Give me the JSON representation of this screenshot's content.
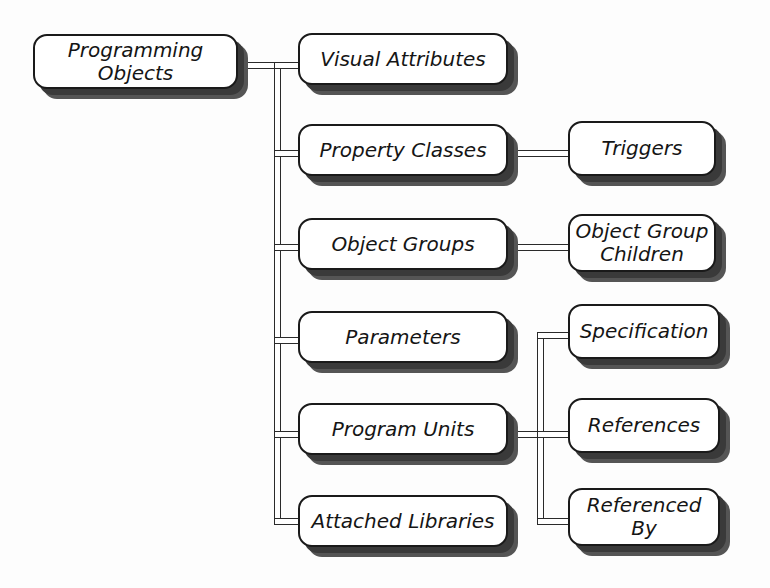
{
  "diagram": {
    "root": {
      "label": "Programming Objects"
    },
    "level1": [
      {
        "label": "Visual Attributes"
      },
      {
        "label": "Property Classes"
      },
      {
        "label": "Object Groups"
      },
      {
        "label": "Parameters"
      },
      {
        "label": "Program Units"
      },
      {
        "label": "Attached Libraries"
      }
    ],
    "level2": {
      "property_classes": [
        {
          "label": "Triggers"
        }
      ],
      "object_groups": [
        {
          "label_line1": "Object Group",
          "label_line2": "Children"
        }
      ],
      "program_units": [
        {
          "label": "Specification"
        },
        {
          "label": "References"
        },
        {
          "label_line1": "Referenced",
          "label_line2": "By"
        }
      ]
    },
    "colors": {
      "border": "#1a1a1a",
      "shadow": "#3a3a3a",
      "background": "#ffffff"
    }
  }
}
